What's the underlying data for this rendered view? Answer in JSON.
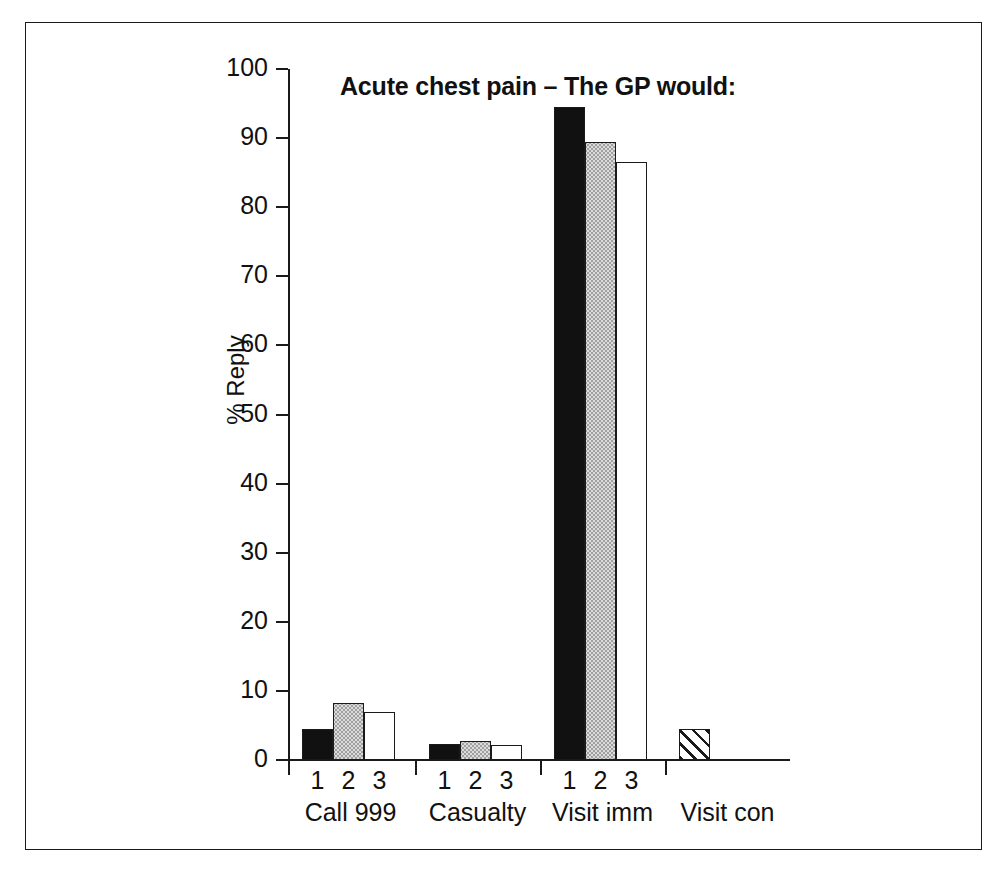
{
  "chart_data": {
    "type": "bar",
    "title": "Acute chest pain – The GP would:",
    "xlabel": "",
    "ylabel": "% Reply",
    "ylim": [
      0,
      100
    ],
    "ytick_labels": [
      "0",
      "10",
      "20",
      "30",
      "40",
      "50",
      "60",
      "70",
      "80",
      "90",
      "100"
    ],
    "yticks": [
      0,
      10,
      20,
      30,
      40,
      50,
      60,
      70,
      80,
      90,
      100
    ],
    "grid": false,
    "legend": "none",
    "categories": [
      "Call 999",
      "Casualty",
      "Visit imm",
      "Visit con"
    ],
    "series_labels": [
      "1",
      "2",
      "3"
    ],
    "series": [
      {
        "name": "1",
        "values": [
          4.5,
          2.3,
          94.5,
          4.5
        ]
      },
      {
        "name": "2",
        "values": [
          8.2,
          2.8,
          89.5,
          null
        ]
      },
      {
        "name": "3",
        "values": [
          7.0,
          2.2,
          86.5,
          null
        ]
      }
    ],
    "bar_styles": {
      "call_999": [
        "black",
        "gray",
        "white"
      ],
      "casualty": [
        "black",
        "gray",
        "white"
      ],
      "visit_imm": [
        "black",
        "gray",
        "white"
      ],
      "visit_con": [
        "hatch"
      ]
    },
    "colors": {
      "black_fill": "#111111",
      "gray_fill": "#dcdcdc",
      "white_fill": "#ffffff",
      "hatch_fill": "#ffffff",
      "outline": "#1a1a1a",
      "text": "#111111",
      "background": "#ffffff"
    }
  },
  "axis": {
    "ticks": [
      {
        "label": "100",
        "value": 100
      },
      {
        "label": "90",
        "value": 90
      },
      {
        "label": "80",
        "value": 80
      },
      {
        "label": "70",
        "value": 70
      },
      {
        "label": "60",
        "value": 60
      },
      {
        "label": "50",
        "value": 50
      },
      {
        "label": "40",
        "value": 40
      },
      {
        "label": "30",
        "value": 30
      },
      {
        "label": "20",
        "value": 20
      },
      {
        "label": "10",
        "value": 10
      },
      {
        "label": "0",
        "value": 0
      }
    ]
  },
  "groups": [
    {
      "category": "Call 999",
      "bars": [
        {
          "label": "1",
          "value": 4.5,
          "style": "black"
        },
        {
          "label": "2",
          "value": 8.2,
          "style": "gray"
        },
        {
          "label": "3",
          "value": 7.0,
          "style": "white"
        }
      ]
    },
    {
      "category": "Casualty",
      "bars": [
        {
          "label": "1",
          "value": 2.3,
          "style": "black"
        },
        {
          "label": "2",
          "value": 2.8,
          "style": "gray"
        },
        {
          "label": "3",
          "value": 2.2,
          "style": "white"
        }
      ]
    },
    {
      "category": "Visit imm",
      "bars": [
        {
          "label": "1",
          "value": 94.5,
          "style": "black"
        },
        {
          "label": "2",
          "value": 89.5,
          "style": "gray"
        },
        {
          "label": "3",
          "value": 86.5,
          "style": "white"
        }
      ]
    },
    {
      "category": "Visit con",
      "bars": [
        {
          "label": "",
          "value": 4.5,
          "style": "hatch"
        }
      ]
    }
  ]
}
